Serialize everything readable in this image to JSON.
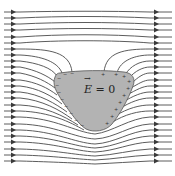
{
  "figure": {
    "label": {
      "symbol": "E",
      "equals": " = 0"
    },
    "colors": {
      "background": "#ffffff",
      "field_line": "#4a4a4a",
      "conductor_fill": "#b3b3b3"
    },
    "field_line_count": 22,
    "arrow_direction": "right",
    "surface_charges": {
      "left_side": "-",
      "right_side": "+"
    }
  }
}
